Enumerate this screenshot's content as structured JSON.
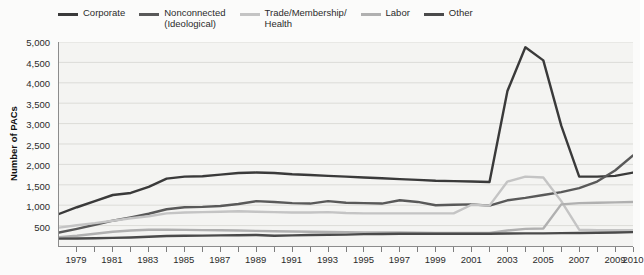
{
  "chart_data": {
    "type": "line",
    "title": "",
    "xlabel": "",
    "ylabel": "Number of PACs",
    "ylim": [
      0,
      5000
    ],
    "xlim": [
      1978,
      2010
    ],
    "grid": true,
    "legend_position": "top",
    "y_ticks": [
      5000,
      4500,
      4000,
      3500,
      3000,
      2500,
      2000,
      1500,
      1000,
      500
    ],
    "y_tick_labels": [
      "5,000",
      "4,500",
      "4,000",
      "3,500",
      "3,000",
      "2,500",
      "2,000",
      "1,500",
      "1,000",
      "500"
    ],
    "x_ticks": [
      1979,
      1981,
      1983,
      1985,
      1987,
      1989,
      1991,
      1993,
      1995,
      1997,
      1999,
      2001,
      2003,
      2005,
      2007,
      2009,
      2010
    ],
    "x_tick_labels": [
      "1979",
      "1981",
      "1983",
      "1985",
      "1987",
      "1989",
      "1991",
      "1993",
      "1995",
      "1997",
      "1999",
      "2001",
      "2003",
      "2005",
      "2007",
      "2009",
      "2010"
    ],
    "x": [
      1978,
      1979,
      1980,
      1981,
      1982,
      1983,
      1984,
      1985,
      1986,
      1987,
      1988,
      1989,
      1990,
      1991,
      1992,
      1993,
      1994,
      1995,
      1996,
      1997,
      1998,
      1999,
      2000,
      2001,
      2002,
      2003,
      2004,
      2005,
      2006,
      2007,
      2008,
      2009,
      2010
    ],
    "series": [
      {
        "name": "Corporate",
        "color": "#3a3a3a",
        "values": [
          785,
          950,
          1100,
          1250,
          1300,
          1450,
          1650,
          1700,
          1710,
          1750,
          1790,
          1800,
          1790,
          1760,
          1740,
          1720,
          1700,
          1680,
          1660,
          1640,
          1620,
          1600,
          1590,
          1580,
          1570,
          3800,
          4870,
          4550,
          2950,
          1700,
          1700,
          1720,
          1800
        ]
      },
      {
        "name": "Nonconnected\n(Ideological)",
        "color": "#595959",
        "values": [
          330,
          420,
          520,
          620,
          700,
          790,
          900,
          950,
          960,
          980,
          1030,
          1100,
          1080,
          1050,
          1040,
          1100,
          1060,
          1050,
          1040,
          1120,
          1080,
          1000,
          1010,
          1020,
          990,
          1120,
          1180,
          1250,
          1320,
          1420,
          1580,
          1850,
          2220
        ]
      },
      {
        "name": "Trade/Membership/\nHealth",
        "color": "#c4c4c4",
        "values": [
          450,
          510,
          560,
          620,
          680,
          730,
          800,
          820,
          830,
          840,
          850,
          840,
          830,
          820,
          820,
          830,
          810,
          800,
          800,
          800,
          800,
          800,
          800,
          1010,
          990,
          1580,
          1700,
          1680,
          1100,
          400,
          390,
          390,
          390
        ]
      },
      {
        "name": "Labor",
        "color": "#b0b0b0",
        "values": [
          215,
          250,
          300,
          350,
          380,
          400,
          400,
          395,
          390,
          385,
          380,
          370,
          360,
          355,
          350,
          345,
          340,
          335,
          330,
          330,
          325,
          320,
          320,
          320,
          320,
          380,
          420,
          430,
          1020,
          1050,
          1060,
          1070,
          1080
        ]
      },
      {
        "name": "Other",
        "color": "#4a4a4a",
        "values": [
          180,
          185,
          190,
          200,
          210,
          225,
          245,
          250,
          255,
          260,
          265,
          270,
          250,
          260,
          270,
          275,
          280,
          290,
          295,
          300,
          300,
          300,
          300,
          300,
          300,
          305,
          310,
          310,
          315,
          320,
          325,
          330,
          340
        ]
      }
    ]
  },
  "legend": {
    "items": [
      {
        "label": "Corporate",
        "color": "#3a3a3a"
      },
      {
        "label": "Nonconnected\n(Ideological)",
        "color": "#595959"
      },
      {
        "label": "Trade/Membership/\nHealth",
        "color": "#c4c4c4"
      },
      {
        "label": "Labor",
        "color": "#b0b0b0"
      },
      {
        "label": "Other",
        "color": "#4a4a4a"
      }
    ]
  },
  "axes": {
    "y_title": "Number of PACs"
  }
}
